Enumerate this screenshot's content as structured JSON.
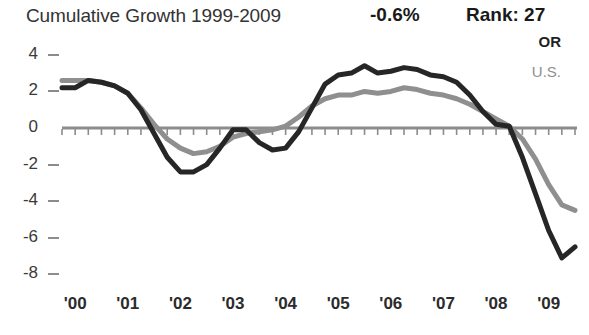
{
  "header": {
    "title": "Cumulative Growth 1999-2009",
    "value": "-0.6%",
    "rank": "Rank: 27"
  },
  "legend": {
    "or_label": "OR",
    "us_label": "U.S."
  },
  "colors": {
    "or": "#262626",
    "us": "#8f8f8f",
    "axis": "#8c8c8c",
    "text": "#2b2b2b"
  },
  "chart_data": {
    "type": "line",
    "title": "Cumulative Growth 1999-2009",
    "xlabel": "",
    "ylabel": "",
    "ylim": [
      -8,
      4
    ],
    "yticks": [
      4,
      2,
      0,
      -2,
      -4,
      -6,
      -8
    ],
    "ytick_labels": [
      "4",
      "2",
      "0",
      "-2",
      "-4",
      "-6",
      "-8"
    ],
    "xtick_labels": [
      "'00",
      "'01",
      "'02",
      "'03",
      "'04",
      "'05",
      "'06",
      "'07",
      "'08",
      "'09"
    ],
    "x_range": [
      "'99 Q4",
      "'09 Q3"
    ],
    "grid": false,
    "legend_position": "top-right",
    "annotations": [
      {
        "text": "-0.6%",
        "role": "headline-value"
      },
      {
        "text": "Rank: 27",
        "role": "headline-rank"
      }
    ],
    "x": [
      1999.75,
      2000.0,
      2000.25,
      2000.5,
      2000.75,
      2001.0,
      2001.25,
      2001.5,
      2001.75,
      2002.0,
      2002.25,
      2002.5,
      2002.75,
      2003.0,
      2003.25,
      2003.5,
      2003.75,
      2004.0,
      2004.25,
      2004.5,
      2004.75,
      2005.0,
      2005.25,
      2005.5,
      2005.75,
      2006.0,
      2006.25,
      2006.5,
      2006.75,
      2007.0,
      2007.25,
      2007.5,
      2007.75,
      2008.0,
      2008.25,
      2008.5,
      2008.75,
      2009.0,
      2009.25,
      2009.5
    ],
    "series": [
      {
        "name": "OR",
        "color": "#262626",
        "values": [
          2.2,
          2.2,
          2.6,
          2.5,
          2.3,
          1.9,
          1.0,
          -0.3,
          -1.6,
          -2.4,
          -2.4,
          -2.0,
          -1.1,
          -0.1,
          -0.1,
          -0.8,
          -1.2,
          -1.1,
          -0.2,
          1.1,
          2.4,
          2.9,
          3.0,
          3.4,
          3.0,
          3.1,
          3.3,
          3.2,
          2.9,
          2.8,
          2.5,
          1.8,
          0.9,
          0.2,
          0.1,
          -1.6,
          -3.6,
          -5.6,
          -7.1,
          -6.5
        ]
      },
      {
        "name": "U.S.",
        "color": "#8f8f8f",
        "values": [
          2.6,
          2.6,
          2.6,
          2.5,
          2.3,
          1.9,
          1.1,
          0.2,
          -0.6,
          -1.1,
          -1.4,
          -1.3,
          -1.0,
          -0.5,
          -0.3,
          -0.2,
          -0.1,
          0.1,
          0.6,
          1.2,
          1.6,
          1.8,
          1.8,
          2.0,
          1.9,
          2.0,
          2.2,
          2.1,
          1.9,
          1.8,
          1.6,
          1.3,
          0.9,
          0.5,
          0.1,
          -0.6,
          -1.7,
          -3.1,
          -4.2,
          -4.5
        ]
      }
    ]
  }
}
